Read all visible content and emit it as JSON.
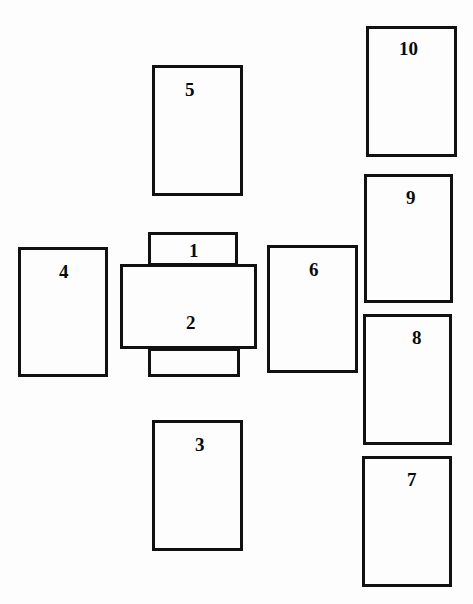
{
  "diagram": {
    "type": "numbered-rectangle-layout",
    "background_color": "#fdfdfd",
    "stroke_color": "#111111",
    "stroke_width_px": 3,
    "canvas": {
      "width": 473,
      "height": 604
    },
    "panels": [
      {
        "id": "panel-5",
        "label": "5",
        "x": 152,
        "y": 65,
        "w": 91,
        "h": 131,
        "label_x": 30,
        "label_y": 12,
        "label_size": 19,
        "stack": "plain"
      },
      {
        "id": "panel-1",
        "label": "1",
        "x": 148,
        "y": 232,
        "w": 90,
        "h": 34,
        "label_x": 38,
        "label_y": 6,
        "label_size": 19,
        "stack": "tab"
      },
      {
        "id": "panel-2",
        "label": "2",
        "x": 120,
        "y": 264,
        "w": 137,
        "h": 85,
        "label_x": 63,
        "label_y": 46,
        "label_size": 19,
        "stack": "main"
      },
      {
        "id": "panel-unlabeled-bottom",
        "label": "",
        "x": 148,
        "y": 348,
        "w": 92,
        "h": 29,
        "label_x": 0,
        "label_y": 0,
        "label_size": 19,
        "stack": "tab"
      },
      {
        "id": "panel-4",
        "label": "4",
        "x": 18,
        "y": 247,
        "w": 90,
        "h": 130,
        "label_x": 38,
        "label_y": 12,
        "label_size": 19,
        "stack": "plain"
      },
      {
        "id": "panel-6",
        "label": "6",
        "x": 267,
        "y": 245,
        "w": 91,
        "h": 128,
        "label_x": 39,
        "label_y": 12,
        "label_size": 19,
        "stack": "plain"
      },
      {
        "id": "panel-3",
        "label": "3",
        "x": 152,
        "y": 420,
        "w": 91,
        "h": 131,
        "label_x": 40,
        "label_y": 12,
        "label_size": 19,
        "stack": "plain"
      },
      {
        "id": "panel-10",
        "label": "10",
        "x": 366,
        "y": 26,
        "w": 91,
        "h": 131,
        "label_x": 30,
        "label_y": 10,
        "label_size": 19,
        "stack": "plain"
      },
      {
        "id": "panel-9",
        "label": "9",
        "x": 364,
        "y": 174,
        "w": 89,
        "h": 129,
        "label_x": 39,
        "label_y": 11,
        "label_size": 19,
        "stack": "plain"
      },
      {
        "id": "panel-8",
        "label": "8",
        "x": 363,
        "y": 314,
        "w": 89,
        "h": 131,
        "label_x": 46,
        "label_y": 11,
        "label_size": 19,
        "stack": "plain"
      },
      {
        "id": "panel-7",
        "label": "7",
        "x": 362,
        "y": 456,
        "w": 90,
        "h": 131,
        "label_x": 42,
        "label_y": 11,
        "label_size": 19,
        "stack": "plain"
      }
    ]
  }
}
